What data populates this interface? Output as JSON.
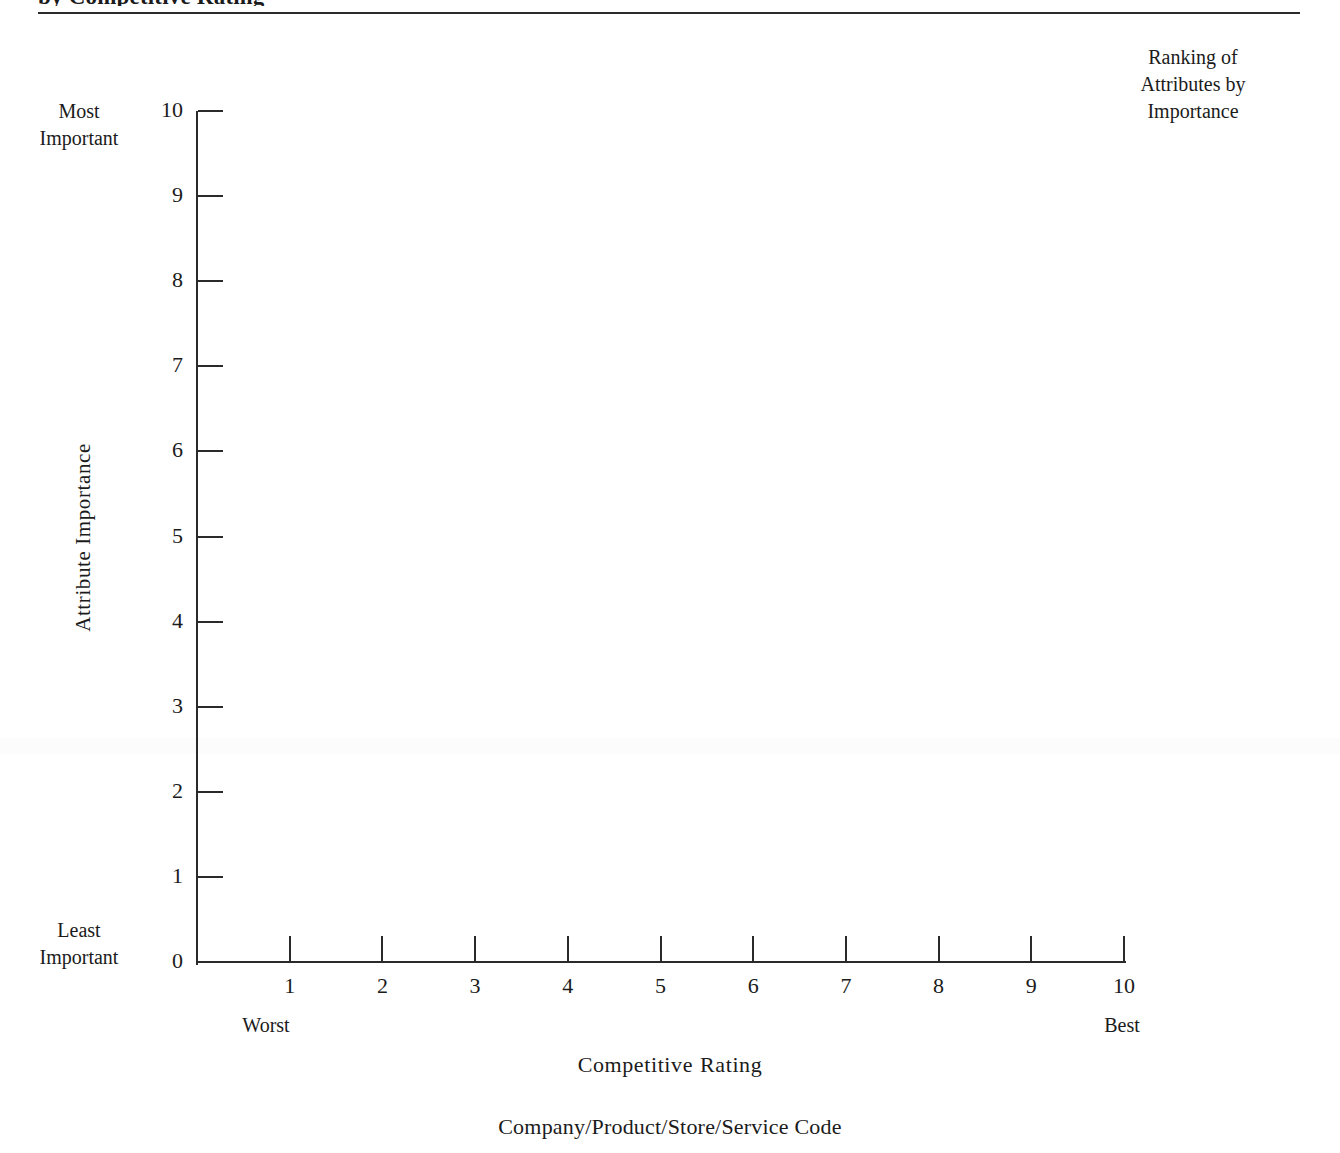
{
  "page": {
    "running_head": "by Competitive Rating",
    "corner_caption_line1": "Ranking of",
    "corner_caption_line2": "Attributes by",
    "corner_caption_line3": "Importance",
    "bottom_caption": "Company/Product/Store/Service Code"
  },
  "chart_data": {
    "type": "scatter",
    "title": "",
    "xlabel": "Competitive",
    "xlabel_word2": "Rating",
    "ylabel": "Attribute  Importance",
    "xlim": [
      0,
      10
    ],
    "ylim": [
      0,
      10
    ],
    "grid": false,
    "legend": null,
    "series": [],
    "x_ticks": [
      0,
      1,
      2,
      3,
      4,
      5,
      6,
      7,
      8,
      9,
      10
    ],
    "x_tick_labels": [
      "",
      "1",
      "2",
      "3",
      "4",
      "5",
      "6",
      "7",
      "8",
      "9",
      "10"
    ],
    "y_ticks": [
      0,
      1,
      2,
      3,
      4,
      5,
      6,
      7,
      8,
      9,
      10
    ],
    "y_tick_labels": [
      "0",
      "1",
      "2",
      "3",
      "4",
      "5",
      "6",
      "7",
      "8",
      "9",
      "10"
    ],
    "x_axis_low_label": "Worst",
    "x_axis_high_label": "Best",
    "y_axis_low_label_line1": "Least",
    "y_axis_low_label_line2": "Important",
    "y_axis_high_label_line1": "Most",
    "y_axis_high_label_line2": "Important",
    "note": "Blank worksheet grid — no data points plotted"
  },
  "colors": {
    "ink": "#1b1b1b",
    "axis": "#2a2a2a",
    "paper": "#ffffff"
  }
}
